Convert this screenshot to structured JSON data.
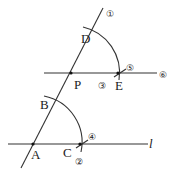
{
  "diagram": {
    "points": {
      "A": "A",
      "B": "B",
      "C": "C",
      "D": "D",
      "E": "E",
      "P": "P"
    },
    "line_label": "l",
    "steps": {
      "s1": "①",
      "s2": "②",
      "s3": "③",
      "s4": "④",
      "s5": "⑤",
      "s6": "⑥"
    },
    "stroke_color": "#333333"
  }
}
